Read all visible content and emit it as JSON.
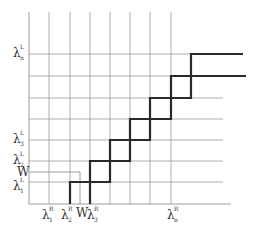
{
  "diagram": {
    "type": "step-function grid",
    "y_axis_labels": [
      {
        "id": "lambda_n_L",
        "base": "λ",
        "sup": "L",
        "sub": "n",
        "y": 54
      },
      {
        "id": "lambda_3_L",
        "base": "λ",
        "sup": "L",
        "sub": "3",
        "y": 140
      },
      {
        "id": "lambda_2_L",
        "base": "λ",
        "sup": "L",
        "sub": "2",
        "y": 161
      },
      {
        "id": "W_left",
        "base": "W",
        "sup": "",
        "sub": "",
        "y": 172
      },
      {
        "id": "lambda_1_L",
        "base": "λ",
        "sup": "L",
        "sub": "1",
        "y": 182
      }
    ],
    "x_axis_labels": [
      {
        "id": "lambda_1_R",
        "base": "λ",
        "sup": "R",
        "sub": "1",
        "x": 49
      },
      {
        "id": "lambda_2_R",
        "base": "λ",
        "sup": "R",
        "sub": "2",
        "x": 70
      },
      {
        "id": "W_bottom",
        "base": "W",
        "sup": "",
        "sub": "",
        "x": 80
      },
      {
        "id": "lambda_3_R",
        "base": "λ",
        "sup": "R",
        "sub": "3",
        "x": 90
      },
      {
        "id": "lambda_n_R",
        "base": "λ",
        "sup": "R",
        "sub": "n",
        "x": 171
      }
    ],
    "grid": {
      "vertical_x": [
        49,
        70,
        90,
        110,
        130,
        150,
        171
      ],
      "horizontal_y": [
        54,
        76,
        98,
        119,
        140,
        161,
        182
      ],
      "axis_x": 29,
      "axis_y": 204,
      "top_y": 12,
      "right_x": 223
    },
    "w_line": {
      "x": 80,
      "y": 172
    },
    "staircases": [
      {
        "name": "upper",
        "points": [
          [
            70,
            204
          ],
          [
            70,
            182
          ],
          [
            110,
            182
          ],
          [
            110,
            140
          ],
          [
            150,
            140
          ],
          [
            150,
            98
          ],
          [
            191,
            98
          ],
          [
            191,
            54
          ],
          [
            243,
            54
          ]
        ]
      },
      {
        "name": "lower",
        "points": [
          [
            90,
            204
          ],
          [
            90,
            161
          ],
          [
            130,
            161
          ],
          [
            130,
            119
          ],
          [
            171,
            119
          ],
          [
            171,
            76
          ],
          [
            246,
            76
          ]
        ]
      }
    ],
    "colors": {
      "grid": "#9a9a9a",
      "thick": "#2a2a2a",
      "text": "#333333"
    }
  }
}
